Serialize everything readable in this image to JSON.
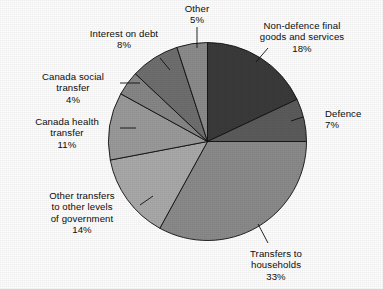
{
  "chart_data": {
    "type": "pie",
    "title": "",
    "subtitle": "",
    "xlabel": "",
    "ylabel": "",
    "legend_position": "none",
    "grid": false,
    "units": "percent",
    "start_angle_deg": 0,
    "direction": "clockwise",
    "categories": [
      "Non-defence final goods and services",
      "Defence",
      "Transfers to households",
      "Other transfers to other levels of government",
      "Canada health transfer",
      "Canada social transfer",
      "Interest on debt",
      "Other"
    ],
    "values": [
      18,
      7,
      33,
      14,
      11,
      4,
      8,
      5
    ],
    "slices": [
      {
        "name": "Non-defence final goods and services",
        "label_line1": "Non-defence final",
        "label_line2": "goods and services",
        "value": 18,
        "value_text": "18%",
        "color": "#3b3b3b"
      },
      {
        "name": "Defence",
        "label_line1": "Defence",
        "label_line2": "",
        "value": 7,
        "value_text": "7%",
        "color": "#5c5c5c"
      },
      {
        "name": "Transfers to households",
        "label_line1": "Transfers to",
        "label_line2": "households",
        "value": 33,
        "value_text": "33%",
        "color": "#8b8b8b"
      },
      {
        "name": "Other transfers to other levels of government",
        "label_line1": "Other transfers",
        "label_line2": "to other levels",
        "label_line3": "of government",
        "value": 14,
        "value_text": "14%",
        "color": "#aaaaaa"
      },
      {
        "name": "Canada health transfer",
        "label_line1": "Canada health",
        "label_line2": "transfer",
        "value": 11,
        "value_text": "11%",
        "color": "#9b9b9b"
      },
      {
        "name": "Canada social transfer",
        "label_line1": "Canada social",
        "label_line2": "transfer",
        "value": 4,
        "value_text": "4%",
        "color": "#878787"
      },
      {
        "name": "Interest on debt",
        "label_line1": "Interest on debt",
        "label_line2": "",
        "value": 8,
        "value_text": "8%",
        "color": "#6f6f6f"
      },
      {
        "name": "Other",
        "label_line1": "Other",
        "label_line2": "",
        "value": 5,
        "value_text": "5%",
        "color": "#8c8c8c"
      }
    ]
  },
  "labels": {
    "non_defence": "Non-defence final\ngoods and services\n18%",
    "defence": "Defence\n7%",
    "transfers_households": "Transfers to\nhouseholds\n33%",
    "other_transfers": "Other transfers\nto other levels\nof government\n14%",
    "canada_health": "Canada health\ntransfer\n11%",
    "canada_social": "Canada social\ntransfer\n4%",
    "interest_debt": "Interest on debt\n8%",
    "other": "Other\n5%"
  },
  "colors": {
    "background": "#ffffff",
    "outline": "#111111",
    "leader_line": "#111111"
  }
}
